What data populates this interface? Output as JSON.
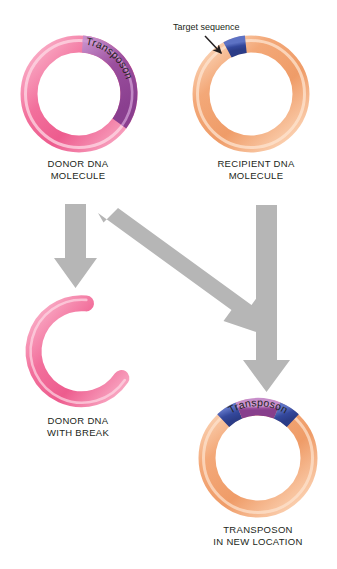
{
  "figure": {
    "background_color": "#ffffff"
  },
  "colors": {
    "dna_pink": "#F2709C",
    "dna_pink_light": "#FBBFD3",
    "dna_peach": "#F3A878",
    "dna_peach_light": "#FBD7BC",
    "transposon_purple": "#9B4F9E",
    "transposon_purple_light": "#C58CC9",
    "target_blue": "#34489C",
    "target_blue_light": "#5B6FC0",
    "arrow_gray": "#B6B6B6",
    "text_black": "#231f20"
  },
  "callouts": {
    "target_sequence": "Target sequence"
  },
  "panels": [
    {
      "id": "donor-dna-molecule",
      "label": "DONOR DNA\nMOLECULE",
      "ring_type": "closed-circle",
      "base_color": "#F2709C",
      "segments": [
        {
          "name": "transposon",
          "label": "Transposon",
          "color": "#9B4F9E",
          "start_deg": -86,
          "end_deg": 36
        }
      ]
    },
    {
      "id": "recipient-dna-molecule",
      "label": "RECIPIENT DNA\nMOLECULE",
      "ring_type": "closed-circle",
      "base_color": "#F3A878",
      "segments": [
        {
          "name": "target-sequence",
          "label": "",
          "color": "#34489C",
          "start_deg": -118,
          "end_deg": -96
        }
      ]
    },
    {
      "id": "donor-dna-with-break",
      "label": "DONOR DNA\nWITH BREAK",
      "ring_type": "broken-circle",
      "base_color": "#F2709C",
      "gap_start_deg": -84,
      "gap_end_deg": 34,
      "segments": []
    },
    {
      "id": "transposon-in-new-location",
      "label": "TRANSPOSON\nIN NEW LOCATION",
      "ring_type": "closed-circle",
      "base_color": "#F3A878",
      "segments": [
        {
          "name": "target-duplication-left",
          "label": "",
          "color": "#34489C",
          "start_deg": -133,
          "end_deg": -112
        },
        {
          "name": "transposon",
          "label": "Transposon",
          "color": "#9B4F9E",
          "start_deg": -112,
          "end_deg": -68
        },
        {
          "name": "target-duplication-right",
          "label": "",
          "color": "#34489C",
          "start_deg": -68,
          "end_deg": -47
        }
      ]
    }
  ],
  "arrows": [
    {
      "name": "donor-to-broken-donor",
      "direction": "down",
      "from": "donor-dna-molecule",
      "to": "donor-dna-with-break"
    },
    {
      "name": "donor-to-recipient-diagonal",
      "direction": "down-right",
      "from": "donor-dna-molecule",
      "to": "transposon-in-new-location"
    },
    {
      "name": "recipient-to-result",
      "direction": "down",
      "from": "recipient-dna-molecule",
      "to": "transposon-in-new-location"
    }
  ]
}
